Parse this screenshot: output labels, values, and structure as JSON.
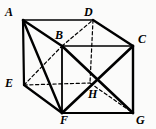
{
  "figure": {
    "kind": "geometry-diagram",
    "shape": "cube",
    "background_color": "#fbfbfa",
    "stroke_color": "#000000"
  },
  "vertices": [
    {
      "name": "A",
      "label": "A",
      "x": 23,
      "y": 20,
      "label_x": 5,
      "label_y": 6
    },
    {
      "name": "B",
      "label": "B",
      "x": 62,
      "y": 46,
      "label_x": 55,
      "label_y": 29
    },
    {
      "name": "C",
      "label": "C",
      "x": 133,
      "y": 46,
      "label_x": 138,
      "label_y": 33
    },
    {
      "name": "D",
      "label": "D",
      "x": 93,
      "y": 20,
      "label_x": 84,
      "label_y": 6
    },
    {
      "name": "E",
      "label": "E",
      "x": 24,
      "y": 85,
      "label_x": 5,
      "label_y": 77
    },
    {
      "name": "F",
      "label": "F",
      "x": 62,
      "y": 113,
      "label_x": 60,
      "label_y": 114
    },
    {
      "name": "G",
      "label": "G",
      "x": 133,
      "y": 113,
      "label_x": 136,
      "label_y": 114
    },
    {
      "name": "H",
      "label": "H",
      "x": 90,
      "y": 83,
      "label_x": 88,
      "label_y": 88
    }
  ],
  "edges": [
    {
      "name": "edge-A-D",
      "from": "A",
      "to": "D",
      "style": "solid",
      "width": 1.6
    },
    {
      "name": "edge-D-C",
      "from": "D",
      "to": "C",
      "style": "solid",
      "width": 2.4
    },
    {
      "name": "edge-C-G",
      "from": "C",
      "to": "G",
      "style": "solid",
      "width": 2.4
    },
    {
      "name": "edge-G-F",
      "from": "G",
      "to": "F",
      "style": "solid",
      "width": 2.2
    },
    {
      "name": "edge-F-E",
      "from": "F",
      "to": "E",
      "style": "solid",
      "width": 2.2
    },
    {
      "name": "edge-E-A",
      "from": "E",
      "to": "A",
      "style": "solid",
      "width": 2.2
    },
    {
      "name": "edge-A-B",
      "from": "A",
      "to": "B",
      "style": "solid",
      "width": 2.4
    },
    {
      "name": "edge-B-C",
      "from": "B",
      "to": "C",
      "style": "solid",
      "width": 1.6
    },
    {
      "name": "edge-B-F",
      "from": "B",
      "to": "F",
      "style": "solid",
      "width": 1.8
    },
    {
      "name": "edge-B-D",
      "from": "B",
      "to": "D",
      "style": "dashed",
      "width": 1.2
    },
    {
      "name": "edge-D-H",
      "from": "D",
      "to": "H",
      "style": "dashed",
      "width": 1.2
    },
    {
      "name": "edge-E-H",
      "from": "E",
      "to": "H",
      "style": "dashed",
      "width": 1.2
    },
    {
      "name": "edge-H-G",
      "from": "H",
      "to": "G",
      "style": "dashed",
      "width": 1.2
    }
  ],
  "diagonals": [
    {
      "name": "diagonal-A-F",
      "from": "A",
      "to": "F",
      "style": "solid",
      "width": 2.4
    },
    {
      "name": "diagonal-E-B",
      "from": "E",
      "to": "B",
      "style": "dashed",
      "width": 1.2
    },
    {
      "name": "diagonal-B-G",
      "from": "B",
      "to": "G",
      "style": "solid",
      "width": 2.6
    },
    {
      "name": "diagonal-C-F",
      "from": "C",
      "to": "F",
      "style": "solid",
      "width": 2.6
    }
  ]
}
